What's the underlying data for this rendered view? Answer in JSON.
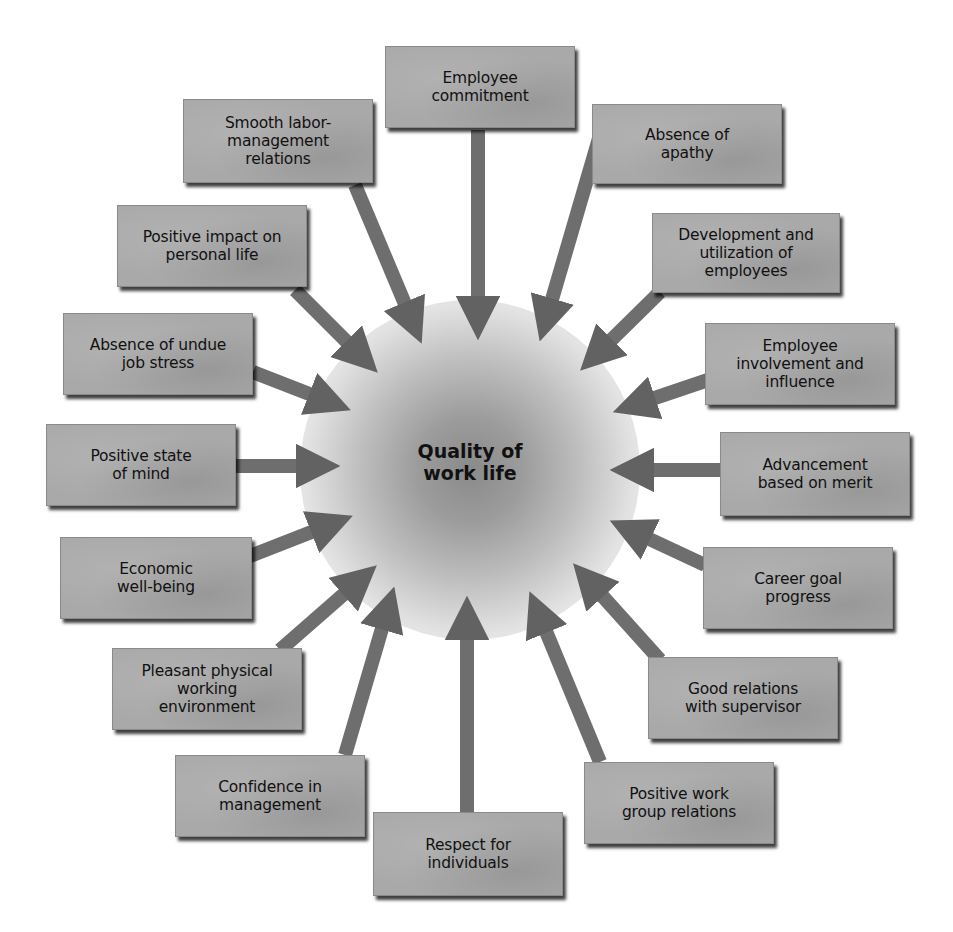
{
  "center": {
    "label_line1": "Quality of",
    "label_line2": "work life"
  },
  "colors": {
    "box_fill": "#a9a9a9",
    "arrow_fill": "#6e6e6e",
    "hub_center": "#8a8a8a",
    "text": "#111111",
    "background": "#ffffff"
  },
  "factors": [
    {
      "id": "employee-commitment",
      "label": "Employee\ncommitment"
    },
    {
      "id": "absence-of-apathy",
      "label": "Absence of\napathy"
    },
    {
      "id": "development-utilization",
      "label": "Development and\nutilization of\nemployees"
    },
    {
      "id": "employee-involvement",
      "label": "Employee\ninvolvement and\ninfluence"
    },
    {
      "id": "advancement-merit",
      "label": "Advancement\nbased on merit"
    },
    {
      "id": "career-goal-progress",
      "label": "Career goal\nprogress"
    },
    {
      "id": "good-relations-supervisor",
      "label": "Good relations\nwith supervisor"
    },
    {
      "id": "positive-work-group",
      "label": "Positive work\ngroup relations"
    },
    {
      "id": "respect-individuals",
      "label": "Respect for\nindividuals"
    },
    {
      "id": "confidence-management",
      "label": "Confidence in\nmanagement"
    },
    {
      "id": "pleasant-environment",
      "label": "Pleasant physical\nworking\nenvironment"
    },
    {
      "id": "economic-well-being",
      "label": "Economic\nwell-being"
    },
    {
      "id": "positive-state-of-mind",
      "label": "Positive state\nof mind"
    },
    {
      "id": "absence-job-stress",
      "label": "Absence of undue\njob stress"
    },
    {
      "id": "positive-impact-personal-life",
      "label": "Positive impact on\npersonal life"
    },
    {
      "id": "smooth-labor-relations",
      "label": "Smooth labor-\nmanagement\nrelations"
    }
  ]
}
